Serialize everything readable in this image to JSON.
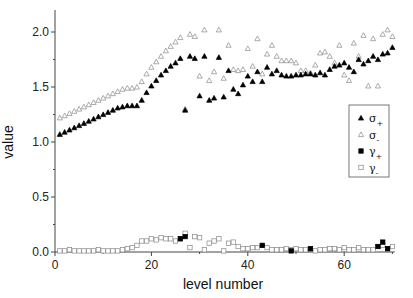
{
  "chart_data": {
    "type": "scatter",
    "title": "",
    "xlabel": "level number",
    "ylabel": "value",
    "xlim": [
      0,
      70.5
    ],
    "ylim": [
      0,
      2.2
    ],
    "xticks": [
      0,
      20,
      40,
      60
    ],
    "xtick_labels": [
      "0",
      "20",
      "40",
      "60"
    ],
    "yticks": [
      0.0,
      0.5,
      1.0,
      1.5,
      2.0
    ],
    "ytick_labels": [
      "0.0",
      "0.5",
      "1.0",
      "1.5",
      "2.0"
    ],
    "grid": false,
    "legend_position": "right-middle, inside",
    "series": [
      {
        "name": "σ+",
        "marker": "filled-triangle",
        "x": [
          1,
          2,
          3,
          4,
          5,
          6,
          7,
          8,
          9,
          10,
          11,
          12,
          13,
          14,
          15,
          16,
          17,
          18,
          19,
          20,
          21,
          22,
          23,
          24,
          25,
          26,
          27,
          28,
          29,
          30,
          31,
          32,
          33,
          34,
          35,
          36,
          37,
          38,
          39,
          40,
          41,
          42,
          43,
          44,
          45,
          46,
          47,
          48,
          49,
          50,
          51,
          52,
          53,
          54,
          55,
          56,
          57,
          58,
          59,
          60,
          61,
          62,
          63,
          64,
          65,
          66,
          67,
          68,
          69,
          70
        ],
        "values": [
          1.07,
          1.09,
          1.11,
          1.13,
          1.15,
          1.17,
          1.19,
          1.21,
          1.23,
          1.25,
          1.27,
          1.29,
          1.31,
          1.32,
          1.33,
          1.33,
          1.33,
          1.38,
          1.45,
          1.51,
          1.56,
          1.61,
          1.65,
          1.69,
          1.72,
          1.76,
          1.29,
          1.78,
          1.76,
          1.42,
          1.78,
          1.38,
          1.4,
          1.77,
          1.41,
          1.65,
          1.48,
          1.44,
          1.52,
          1.6,
          1.55,
          1.64,
          1.55,
          1.68,
          1.62,
          1.65,
          1.61,
          1.6,
          1.6,
          1.61,
          1.61,
          1.62,
          1.62,
          1.61,
          1.63,
          1.61,
          1.66,
          1.69,
          1.7,
          1.72,
          1.68,
          1.64,
          1.75,
          1.71,
          1.74,
          1.78,
          1.75,
          1.8,
          1.81,
          1.86
        ],
        "color": "#000000"
      },
      {
        "name": "σ-",
        "marker": "open-triangle",
        "x": [
          1,
          2,
          3,
          4,
          5,
          6,
          7,
          8,
          9,
          10,
          11,
          12,
          13,
          14,
          15,
          16,
          17,
          18,
          19,
          20,
          21,
          22,
          23,
          24,
          25,
          26,
          27,
          28,
          29,
          30,
          31,
          32,
          33,
          34,
          35,
          36,
          37,
          38,
          39,
          40,
          41,
          42,
          43,
          44,
          45,
          46,
          47,
          48,
          49,
          50,
          51,
          52,
          53,
          54,
          55,
          56,
          57,
          58,
          59,
          60,
          61,
          62,
          63,
          64,
          65,
          66,
          67,
          68,
          69,
          70
        ],
        "values": [
          1.22,
          1.24,
          1.26,
          1.28,
          1.3,
          1.32,
          1.34,
          1.36,
          1.38,
          1.4,
          1.42,
          1.44,
          1.46,
          1.48,
          1.49,
          1.49,
          1.5,
          1.55,
          1.62,
          1.68,
          1.73,
          1.78,
          1.83,
          1.87,
          1.91,
          1.95,
          1.3,
          1.98,
          1.96,
          1.6,
          2.02,
          1.56,
          1.64,
          2.02,
          1.58,
          1.88,
          1.66,
          1.65,
          1.66,
          1.85,
          1.69,
          1.94,
          1.62,
          1.8,
          1.88,
          1.78,
          1.74,
          1.74,
          1.74,
          1.72,
          1.65,
          1.65,
          1.63,
          1.7,
          1.81,
          1.82,
          1.78,
          1.72,
          1.88,
          1.61,
          1.56,
          1.9,
          1.78,
          1.97,
          1.51,
          1.94,
          1.51,
          1.98,
          2.02,
          1.96
        ],
        "color": "#888888"
      },
      {
        "name": "γ+",
        "marker": "filled-square",
        "x": [
          26,
          27,
          43,
          49,
          53,
          67,
          68,
          69
        ],
        "values": [
          0.12,
          0.14,
          0.06,
          0.01,
          0.03,
          0.05,
          0.09,
          0.03
        ],
        "color": "#000000"
      },
      {
        "name": "γ-",
        "marker": "open-square",
        "x": [
          1,
          2,
          3,
          4,
          5,
          6,
          7,
          8,
          9,
          10,
          11,
          12,
          13,
          14,
          15,
          16,
          17,
          18,
          19,
          20,
          21,
          22,
          23,
          24,
          25,
          26,
          27,
          28,
          29,
          30,
          31,
          32,
          33,
          34,
          35,
          36,
          37,
          38,
          39,
          40,
          41,
          42,
          43,
          44,
          45,
          46,
          47,
          48,
          49,
          50,
          51,
          52,
          53,
          54,
          55,
          56,
          57,
          58,
          59,
          60,
          61,
          62,
          63,
          64,
          65,
          66,
          67,
          68,
          69,
          70
        ],
        "values": [
          0.01,
          0.01,
          0.02,
          0.01,
          0.01,
          0.01,
          0.01,
          0.01,
          0.02,
          0.01,
          0.01,
          0.01,
          0.01,
          0.02,
          0.03,
          0.04,
          0.06,
          0.1,
          0.1,
          0.12,
          0.11,
          0.13,
          0.12,
          0.12,
          0.1,
          0.12,
          0.17,
          0.04,
          0.14,
          0.13,
          0.02,
          0.08,
          0.1,
          0.12,
          0.01,
          0.08,
          0.09,
          0.05,
          0.03,
          0.03,
          0.04,
          0.04,
          0.06,
          0.04,
          0.02,
          0.02,
          0.02,
          0.03,
          0.02,
          0.03,
          0.02,
          0.02,
          0.03,
          0.01,
          0.02,
          0.02,
          0.03,
          0.03,
          0.02,
          0.04,
          0.02,
          0.02,
          0.04,
          0.02,
          0.02,
          0.02,
          0.05,
          0.06,
          0.03,
          0.05
        ],
        "color": "#888888"
      }
    ]
  },
  "legend": {
    "items": [
      {
        "label": "σ",
        "sub": "+",
        "marker": "filled-triangle"
      },
      {
        "label": "σ",
        "sub": "-",
        "marker": "open-triangle"
      },
      {
        "label": "γ",
        "sub": "+",
        "marker": "filled-square"
      },
      {
        "label": "γ",
        "sub": "-",
        "marker": "open-square"
      }
    ]
  }
}
